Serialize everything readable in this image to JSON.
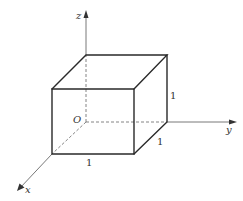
{
  "diagram": {
    "type": "unit-cube-in-3d-axes",
    "axes": {
      "x": {
        "label": "x"
      },
      "y": {
        "label": "y"
      },
      "z": {
        "label": "z"
      }
    },
    "origin": {
      "label": "O"
    },
    "edge_labels": {
      "front_bottom": "1",
      "right_bottom": "1",
      "right_vertical": "1"
    },
    "colors": {
      "edge": "#2a2a2a",
      "axis": "#555555",
      "background": "#ffffff"
    }
  }
}
